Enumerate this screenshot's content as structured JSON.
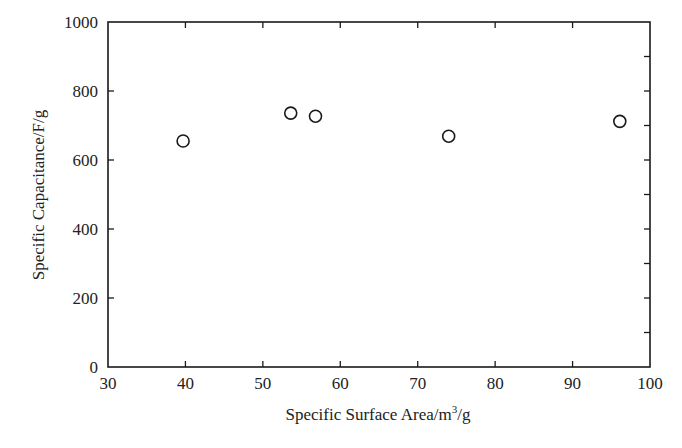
{
  "chart_data": {
    "type": "scatter",
    "title": "",
    "xlabel": "Specific Surface Area/m³/g",
    "xlabel_parts": {
      "main": "Specific Surface Area/m",
      "sup": "3",
      "tail": "/g"
    },
    "ylabel": "Specific Capacitance/F/g",
    "xlim": [
      30,
      100
    ],
    "ylim": [
      0,
      1000
    ],
    "xticks": [
      30,
      40,
      50,
      60,
      70,
      80,
      90,
      100
    ],
    "yticks": [
      0,
      200,
      400,
      600,
      800,
      1000
    ],
    "y_minor_step": 100,
    "grid": false,
    "legend": null,
    "marker": "open-circle",
    "series": [
      {
        "name": "samples",
        "points": [
          {
            "x": 39.7,
            "y": 655
          },
          {
            "x": 53.6,
            "y": 736
          },
          {
            "x": 56.8,
            "y": 727
          },
          {
            "x": 74.0,
            "y": 669
          },
          {
            "x": 96.1,
            "y": 712
          }
        ]
      }
    ]
  },
  "colors": {
    "axis": "#1a1a1a",
    "marker": "#1a1a1a",
    "background": "#ffffff"
  }
}
